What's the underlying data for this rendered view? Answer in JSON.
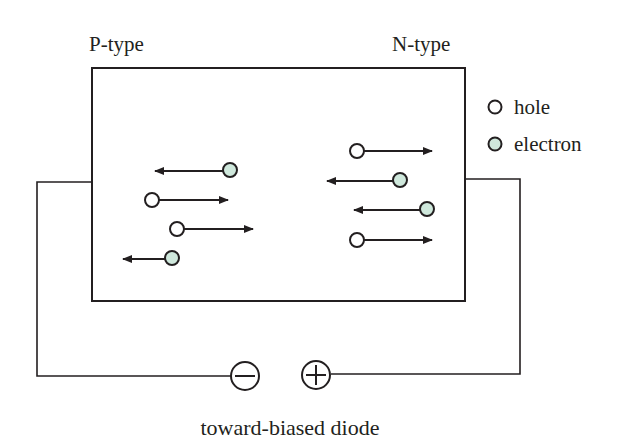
{
  "diagram": {
    "labels": {
      "p_type": "P-type",
      "n_type": "N-type",
      "caption": "toward-biased diode"
    },
    "legend": [
      {
        "symbol": "hole",
        "label": "hole",
        "fill": "#ffffff"
      },
      {
        "symbol": "electron",
        "label": "electron",
        "fill": "#cfe8dc"
      }
    ],
    "battery": {
      "negative_terminal": "minus",
      "positive_terminal": "plus"
    },
    "carriers": {
      "p_region": [
        {
          "type": "electron",
          "direction": "left"
        },
        {
          "type": "hole",
          "direction": "right"
        },
        {
          "type": "hole",
          "direction": "right"
        },
        {
          "type": "electron",
          "direction": "left"
        }
      ],
      "n_region": [
        {
          "type": "hole",
          "direction": "right"
        },
        {
          "type": "electron",
          "direction": "left"
        },
        {
          "type": "electron",
          "direction": "left"
        },
        {
          "type": "hole",
          "direction": "right"
        }
      ]
    },
    "colors": {
      "stroke": "#231f20",
      "electron_fill": "#cfe8dc",
      "hole_fill": "#ffffff"
    }
  }
}
